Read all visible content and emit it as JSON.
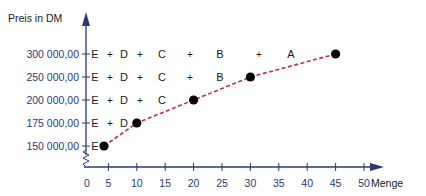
{
  "chart_data": {
    "type": "line",
    "title": "",
    "ylabel": "Preis in DM",
    "xlabel": "Menge",
    "x_ticks": [
      0,
      5,
      10,
      15,
      20,
      25,
      30,
      35,
      40,
      45,
      50
    ],
    "y_ticks": [
      150000,
      175000,
      200000,
      250000,
      300000
    ],
    "y_tick_labels": [
      "150 000,00",
      "175 000,00",
      "200 000,00",
      "250 000,00",
      "300 000,00"
    ],
    "x_range": [
      0,
      50
    ],
    "y_axis_break": true,
    "grid": false,
    "legend": null,
    "series": [
      {
        "name": "Preis-Mengen-Kurve",
        "style": "dashed",
        "color": "#c0303e",
        "marker": "filled-circle",
        "points": [
          {
            "x": 5,
            "y": 150000
          },
          {
            "x": 10,
            "y": 175000
          },
          {
            "x": 20,
            "y": 200000
          },
          {
            "x": 30,
            "y": 250000
          },
          {
            "x": 45,
            "y": 300000
          }
        ]
      }
    ],
    "annotations": [
      {
        "y": 300000,
        "labels": [
          "E",
          "+",
          "D",
          "+",
          "C",
          "+",
          "B",
          "+",
          "A"
        ]
      },
      {
        "y": 250000,
        "labels": [
          "E",
          "+",
          "D",
          "+",
          "C",
          "+",
          "B"
        ]
      },
      {
        "y": 200000,
        "labels": [
          "E",
          "+",
          "D",
          "+",
          "C"
        ]
      },
      {
        "y": 175000,
        "labels": [
          "E",
          "+",
          "D"
        ]
      },
      {
        "y": 150000,
        "labels": [
          "E"
        ]
      }
    ]
  },
  "colors": {
    "axis": "#2a3a78",
    "curve": "#c0303e",
    "points": "#000000",
    "text": "#1a1a1a"
  }
}
